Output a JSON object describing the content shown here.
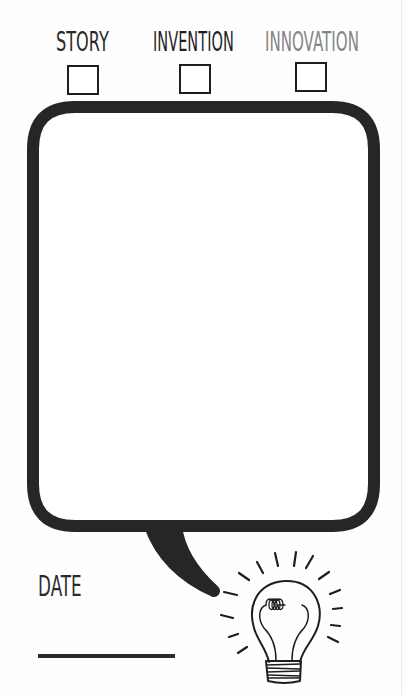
{
  "categories": {
    "story": {
      "label": "STORY",
      "checked": false
    },
    "invention": {
      "label": "INVENTION",
      "checked": false
    },
    "innovation": {
      "label": "INNOVATION",
      "checked": false
    }
  },
  "bubble": {
    "content": "",
    "stroke_color": "#262626"
  },
  "date": {
    "label": "DATE",
    "value": ""
  },
  "illustration": {
    "icon": "lightbulb-icon"
  },
  "colors": {
    "ink": "#1e1e1e",
    "innovation_label": "#858585",
    "background": "#fefefe"
  }
}
